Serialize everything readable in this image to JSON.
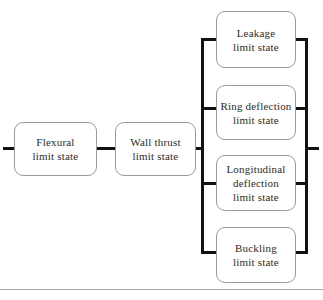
{
  "diagram": {
    "type": "flowchart",
    "orientation": "left-to-right",
    "accent_color": "#111111",
    "box_border_color": "#9a9a9a",
    "text_color": "#2b2b2b",
    "background_color": "#ffffff",
    "rule_color": "#a8a8a8",
    "nodes": [
      {
        "id": "flexural",
        "label": "Flexural\nlimit state",
        "column": "left",
        "order": 1
      },
      {
        "id": "wallthrust",
        "label": "Wall thrust\nlimit state",
        "column": "left",
        "order": 2
      },
      {
        "id": "leakage",
        "label": "Leakage\nlimit state",
        "column": "right",
        "order": 1
      },
      {
        "id": "ring",
        "label": "Ring deflection\nlimit state",
        "column": "right",
        "order": 2
      },
      {
        "id": "longitudinal",
        "label": "Longitudinal\ndeflection\nlimit state",
        "column": "right",
        "order": 3
      },
      {
        "id": "buckling",
        "label": "Buckling\nlimit state",
        "column": "right",
        "order": 4
      }
    ],
    "connectors": [
      {
        "id": "entry-stub",
        "kind": "horizontal"
      },
      {
        "id": "flexural-to-wallthrust",
        "kind": "horizontal"
      },
      {
        "id": "wallthrust-to-left-bus",
        "kind": "horizontal"
      },
      {
        "id": "left-bus",
        "kind": "vertical"
      },
      {
        "id": "left-bus-to-leakage",
        "kind": "horizontal"
      },
      {
        "id": "left-bus-to-ring",
        "kind": "horizontal"
      },
      {
        "id": "left-bus-to-longitudinal",
        "kind": "horizontal"
      },
      {
        "id": "left-bus-to-buckling",
        "kind": "horizontal"
      },
      {
        "id": "leakage-to-right-bus",
        "kind": "horizontal"
      },
      {
        "id": "ring-to-right-bus",
        "kind": "horizontal"
      },
      {
        "id": "longitudinal-to-right-bus",
        "kind": "horizontal"
      },
      {
        "id": "buckling-to-right-bus",
        "kind": "horizontal"
      },
      {
        "id": "right-bus",
        "kind": "vertical"
      },
      {
        "id": "exit-stub",
        "kind": "horizontal"
      }
    ]
  }
}
